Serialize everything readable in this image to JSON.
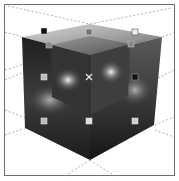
{
  "viewport": {
    "frame_color": "#6e6e6e",
    "background": "#ffffff",
    "grid_color": "#9a9a9a"
  },
  "object": {
    "type": "cube",
    "shading": "grayscale gradient",
    "colors": {
      "top_light": "#d8d8d8",
      "top_dark": "#6a6a6a",
      "left_face": "#2a2a2a",
      "right_face": "#3a3a3a",
      "highlight": "#f2f2f2",
      "edge_dark": "#111111"
    }
  },
  "selection": {
    "handles": [
      {
        "x": 44,
        "y": 31,
        "tone": "dark"
      },
      {
        "x": 89,
        "y": 32,
        "tone": "mid"
      },
      {
        "x": 135,
        "y": 32,
        "tone": "light"
      },
      {
        "x": 49,
        "y": 45,
        "tone": "mid"
      },
      {
        "x": 131,
        "y": 44,
        "tone": "mid"
      },
      {
        "x": 44,
        "y": 77,
        "tone": "light"
      },
      {
        "x": 135,
        "y": 77,
        "tone": "dark"
      },
      {
        "x": 44,
        "y": 121,
        "tone": "light"
      },
      {
        "x": 89,
        "y": 121,
        "tone": "light"
      },
      {
        "x": 135,
        "y": 121,
        "tone": "light"
      }
    ],
    "pivot": {
      "x": 89,
      "y": 77,
      "icon": "x-cross"
    }
  }
}
